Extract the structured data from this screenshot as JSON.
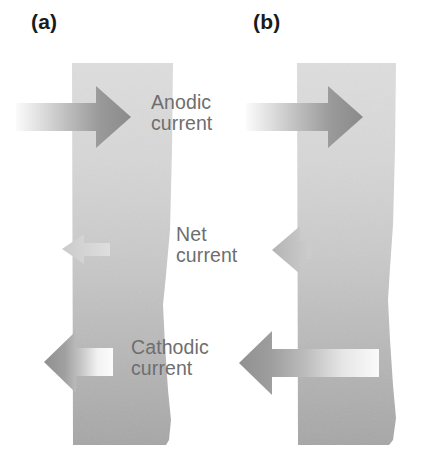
{
  "figure": {
    "type": "scientific-diagram",
    "background_color": "#ffffff"
  },
  "panels": [
    {
      "id": "a",
      "label": "(a)",
      "slab": {
        "x": 72,
        "y": 63,
        "width": 101,
        "height": 382,
        "fill_top": "#dcdcdc",
        "fill_bottom": "#a9a9a9"
      },
      "arrows": [
        {
          "name": "anodic-current-arrow",
          "direction": "right",
          "magnitude": "large",
          "tip_x": 131,
          "y": 117,
          "tail_x": 16,
          "color_head": "#8e8e8e",
          "color_tail": "#ececec"
        },
        {
          "name": "net-current-arrow",
          "direction": "left",
          "magnitude": "small",
          "tip_x": 62,
          "y": 249,
          "tail_x": 110,
          "color_head": "#cfcfcf",
          "color_tail": "#dddddd"
        },
        {
          "name": "cathodic-current-arrow",
          "direction": "left",
          "magnitude": "large",
          "tip_x": 44,
          "y": 362,
          "tail_x": 113,
          "color_head": "#9a9a9a",
          "color_tail": "#f2f2f2"
        }
      ]
    },
    {
      "id": "b",
      "label": "(b)",
      "slab": {
        "x": 297,
        "y": 63,
        "width": 99,
        "height": 382,
        "fill_top": "#dcdcdc",
        "fill_bottom": "#a9a9a9"
      },
      "arrows": [
        {
          "name": "anodic-current-arrow",
          "direction": "right",
          "magnitude": "large",
          "tip_x": 363,
          "y": 117,
          "tail_x": 246,
          "color_head": "#8e8e8e",
          "color_tail": "#ececec"
        },
        {
          "name": "net-current-arrow",
          "direction": "left",
          "magnitude": "medium",
          "tip_x": 272,
          "y": 250,
          "tail_x": 311,
          "color_head": "#bcbcbc",
          "color_tail": "#cccccc"
        },
        {
          "name": "cathodic-current-arrow",
          "direction": "left",
          "magnitude": "large",
          "tip_x": 239,
          "y": 363,
          "tail_x": 379,
          "color_head": "#9a9a9a",
          "color_tail": "#f6f6f6"
        }
      ]
    }
  ],
  "captions": {
    "anodic": "Anodic\ncurrent",
    "net": "Net\ncurrent",
    "cathodic": "Cathodic\ncurrent",
    "color": "#6e6e6e"
  }
}
